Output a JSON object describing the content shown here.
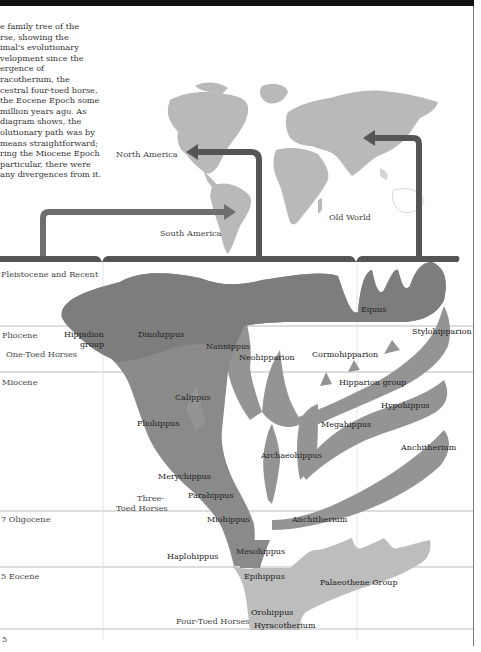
{
  "intro_text": "e family tree of the\nrse, showing the\nimal's evolutionary\nvelopment since the\nergence of\nracotherium, the\ncestral four-toed horse,\nthe Eocene Epoch some\n million years ago. As\n diagram shows, the\nolutionary path was by\n means straightforward;\nring the Miocene Epoch\nparticular, there were\nany divergences from it.",
  "map": {
    "labels": {
      "north_america": "North America",
      "south_america": "South America",
      "old_world": "Old World"
    }
  },
  "epochs": [
    {
      "label": "Pleistocene and Recent",
      "display": "Pleistocene and Recent"
    },
    {
      "label": "Pliocene"
    },
    {
      "label": "Miocene"
    },
    {
      "label": "Oligocene",
      "display": "7 Oligocene"
    },
    {
      "label": "Eocene",
      "display": "5 Eocene"
    },
    {
      "label": "5"
    }
  ],
  "groups": {
    "one_toed": "One-Toed Horses",
    "three_toed_1": "Three-",
    "three_toed_2": "Toed Horses",
    "four_toed": "Four-Toed Horses"
  },
  "species": {
    "hippidion_1": "Hippidion",
    "hippidion_2": "group",
    "dinohippus": "Dinohippus",
    "equus": "Equus",
    "nannippus": "Nannippus",
    "neohipparion": "Neohipparion",
    "cormohipparion": "Cormohipparion",
    "stylohipparion": "Stylohipparion",
    "hipparion_group": "Hipparion group",
    "hypohippus": "Hypohippus",
    "calippus": "Calippus",
    "pliohippus": "Pliohippus",
    "megahippus": "Megahippus",
    "anchitherium_right": "Anchitherium",
    "archaeohippus": "Archaeohippus",
    "merychippus": "Merychippus",
    "parahippus": "Parahippus",
    "miohippus": "Miohippus",
    "anchitherium_center": "Anchitherium",
    "mesohippus": "Mesohippus",
    "haplohippus": "Haplohippus",
    "epihippus": "Epihippus",
    "palaeothene_group": "Palaeothene Group",
    "orohippus": "Orohippus",
    "hyracotherium": "Hyracotherium"
  },
  "colors": {
    "map_land": "#b9b9b9",
    "arrow": "#555555",
    "tree_dark": "#868686",
    "tree_mid": "#9a9a9a",
    "tree_light": "#bdbdbd",
    "top_bar": "#111111"
  }
}
